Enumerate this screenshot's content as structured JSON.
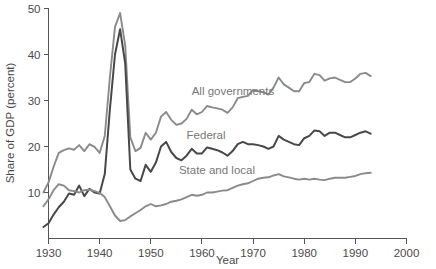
{
  "chart_data": {
    "type": "line",
    "title": "",
    "xlabel": "Year",
    "ylabel": "Share of GDP (percent)",
    "xlim": [
      1928,
      2000
    ],
    "ylim": [
      0,
      50
    ],
    "grid": false,
    "legend_position": "inline-annotations",
    "x_ticks": [
      "1930",
      "1940",
      "1950",
      "1960",
      "1970",
      "1980",
      "1990",
      "2000"
    ],
    "x_tick_values": [
      1930,
      1940,
      1950,
      1960,
      1970,
      1980,
      1990,
      2000
    ],
    "y_ticks": [
      "10",
      "20",
      "30",
      "40",
      "50"
    ],
    "y_tick_values": [
      10,
      20,
      30,
      40,
      50
    ],
    "colors": {
      "all_governments": "#8a8a8a",
      "federal": "#484848",
      "state_and_local": "#8a8a8a",
      "axis": "#555555",
      "text": "#4a4a4a",
      "label_text": "#777777",
      "background": "#ffffff"
    },
    "x": [
      1929,
      1930,
      1931,
      1932,
      1933,
      1934,
      1935,
      1936,
      1937,
      1938,
      1939,
      1940,
      1941,
      1942,
      1943,
      1944,
      1945,
      1946,
      1947,
      1948,
      1949,
      1950,
      1951,
      1952,
      1953,
      1954,
      1955,
      1956,
      1957,
      1958,
      1959,
      1960,
      1961,
      1962,
      1963,
      1964,
      1965,
      1966,
      1967,
      1968,
      1969,
      1970,
      1971,
      1972,
      1973,
      1974,
      1975,
      1976,
      1977,
      1978,
      1979,
      1980,
      1981,
      1982,
      1983,
      1984,
      1985,
      1986,
      1987,
      1988,
      1989,
      1990,
      1991,
      1992,
      1993
    ],
    "series": [
      {
        "name": "All governments",
        "label": "All governments",
        "color": "#8a8a8a",
        "values": [
          10.0,
          12.2,
          15.6,
          18.6,
          19.2,
          19.6,
          19.3,
          20.3,
          19.0,
          20.5,
          19.9,
          18.6,
          22.3,
          35.0,
          46.0,
          49.0,
          42.0,
          22.0,
          19.0,
          19.7,
          23.0,
          21.5,
          23.0,
          26.5,
          27.5,
          25.8,
          24.7,
          25.0,
          26.0,
          28.0,
          27.0,
          27.5,
          28.8,
          28.5,
          28.3,
          28.0,
          27.3,
          28.5,
          30.5,
          30.8,
          31.0,
          32.3,
          32.0,
          31.8,
          31.3,
          32.8,
          35.0,
          33.5,
          32.8,
          32.0,
          32.0,
          33.8,
          34.0,
          35.8,
          35.5,
          34.3,
          34.8,
          35.0,
          34.5,
          34.0,
          34.0,
          34.8,
          35.8,
          36.0,
          35.3
        ]
      },
      {
        "name": "Federal",
        "label": "Federal",
        "color": "#484848",
        "values": [
          2.5,
          3.3,
          5.2,
          6.8,
          8.0,
          9.8,
          9.5,
          11.5,
          9.2,
          10.8,
          10.0,
          9.8,
          14.0,
          28.0,
          40.0,
          45.5,
          38.0,
          15.0,
          13.0,
          12.5,
          16.0,
          14.5,
          16.5,
          20.0,
          21.0,
          18.8,
          17.5,
          17.0,
          18.0,
          19.5,
          18.5,
          18.5,
          19.8,
          19.5,
          19.2,
          18.7,
          18.0,
          19.0,
          20.5,
          21.0,
          20.5,
          20.5,
          20.3,
          20.0,
          19.5,
          20.0,
          22.3,
          21.5,
          21.0,
          20.5,
          20.3,
          21.8,
          22.3,
          23.5,
          23.3,
          22.3,
          23.0,
          23.0,
          22.5,
          22.0,
          22.0,
          22.5,
          23.0,
          23.3,
          22.8
        ]
      },
      {
        "name": "State and local",
        "label": "State and local",
        "color": "#8a8a8a",
        "values": [
          7.0,
          8.5,
          10.5,
          11.8,
          11.5,
          10.5,
          10.3,
          10.0,
          10.5,
          10.6,
          10.3,
          9.9,
          9.0,
          7.0,
          5.0,
          3.8,
          4.0,
          4.8,
          5.5,
          6.2,
          7.0,
          7.5,
          7.0,
          7.2,
          7.5,
          8.0,
          8.2,
          8.5,
          9.0,
          9.5,
          9.3,
          9.5,
          10.0,
          10.0,
          10.2,
          10.4,
          10.5,
          11.0,
          11.5,
          11.8,
          12.0,
          12.5,
          13.0,
          13.2,
          13.3,
          13.7,
          14.0,
          13.5,
          13.3,
          13.0,
          12.8,
          13.0,
          12.8,
          13.0,
          12.8,
          12.7,
          13.0,
          13.2,
          13.2,
          13.2,
          13.4,
          13.6,
          14.0,
          14.2,
          14.3
        ]
      }
    ],
    "annotations": [
      {
        "text": "All governments",
        "x": 1958.0,
        "y": 31.3,
        "anchor": "start"
      },
      {
        "text": "Federal",
        "x": 1957.0,
        "y": 21.6,
        "anchor": "start"
      },
      {
        "text": "State and local",
        "x": 1955.5,
        "y": 14.1,
        "anchor": "start"
      }
    ]
  }
}
